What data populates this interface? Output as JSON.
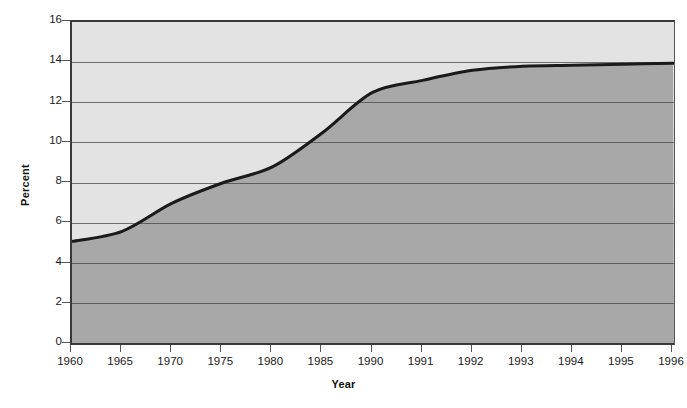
{
  "chart_data": {
    "type": "area",
    "title": "",
    "subtitle": "",
    "xlabel": "Year",
    "ylabel": "Percent",
    "categories": [
      "1960",
      "1965",
      "1970",
      "1975",
      "1980",
      "1985",
      "1990",
      "1991",
      "1992",
      "1993",
      "1994",
      "1995",
      "1996"
    ],
    "values": [
      5.1,
      5.6,
      7.0,
      8.0,
      8.8,
      10.5,
      12.5,
      13.1,
      13.6,
      13.8,
      13.85,
      13.9,
      13.95
    ],
    "series": [
      {
        "name": "Percent",
        "values": [
          5.1,
          5.6,
          7.0,
          8.0,
          8.8,
          10.5,
          12.5,
          13.1,
          13.6,
          13.8,
          13.85,
          13.9,
          13.95
        ]
      }
    ],
    "ylim": [
      0,
      16
    ],
    "yticks": [
      0,
      2,
      4,
      6,
      8,
      10,
      12,
      14,
      16
    ],
    "ytick_labels": [
      "0",
      "2",
      "4",
      "6",
      "8",
      "10",
      "12",
      "14",
      "16"
    ],
    "grid": true,
    "grid_axis": "y",
    "legend": "none",
    "legend_position": "none",
    "annotations": [],
    "colors": {
      "plot_background": "#e3e3e3",
      "area_fill": "#a8a8a8",
      "line": "#1a1a1a",
      "gridline": "#707070",
      "axis": "#3a3a3a",
      "text": "#1a1a1a"
    },
    "line_width": 3,
    "smoothing": "monotone",
    "x_axis_type": "category"
  }
}
